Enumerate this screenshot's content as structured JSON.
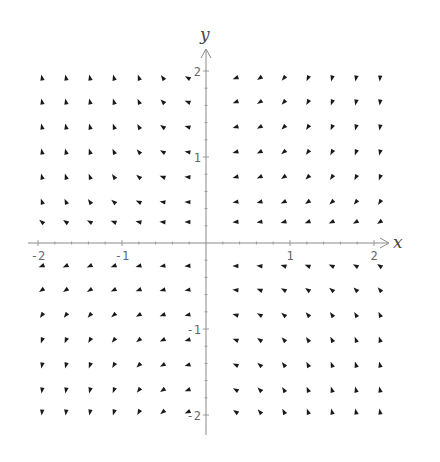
{
  "chart_data": {
    "type": "vector_field",
    "title": "",
    "xlabel": "x",
    "ylabel": "y",
    "xlim": [
      -2.1,
      2.1
    ],
    "ylim": [
      -2.2,
      2.2
    ],
    "grid": false,
    "x_ticks": [
      {
        "value": -2,
        "label": "-2"
      },
      {
        "value": -1,
        "label": "-1"
      },
      {
        "value": 1,
        "label": "1"
      },
      {
        "value": 2,
        "label": "2"
      }
    ],
    "y_ticks": [
      {
        "value": 2,
        "label": "2"
      },
      {
        "value": 1,
        "label": "1"
      },
      {
        "value": -1,
        "label": "-1"
      },
      {
        "value": -2,
        "label": "-2"
      }
    ],
    "pixel_mapping": {
      "origin_px": [
        206,
        243
      ],
      "x_unit_px": 84,
      "y_unit_px": 86
    },
    "arrow_columns_px": {
      "left": [
        42,
        66,
        90,
        114,
        139,
        163,
        188
      ],
      "right": [
        236,
        260,
        284,
        308,
        332,
        356,
        380
      ]
    },
    "arrow_rows_px": {
      "upper": [
        78,
        102,
        127,
        152,
        177,
        202,
        222
      ],
      "lower": [
        266,
        290,
        315,
        340,
        365,
        390,
        412
      ]
    },
    "arrow_angles_deg_note": "estimated visually from glyph orientation; 0 = pointing right, counter-clockwise positive",
    "quadrants": {
      "upper_left": [
        [
          100,
          100,
          102,
          105,
          110,
          125,
          150
        ],
        [
          100,
          101,
          103,
          107,
          115,
          135,
          160
        ],
        [
          101,
          102,
          105,
          110,
          120,
          145,
          165
        ],
        [
          102,
          104,
          108,
          115,
          130,
          150,
          170
        ],
        [
          104,
          107,
          112,
          125,
          140,
          160,
          175
        ],
        [
          110,
          115,
          125,
          140,
          155,
          170,
          178
        ],
        [
          140,
          145,
          150,
          160,
          168,
          175,
          180
        ]
      ],
      "upper_right": [
        [
          200,
          215,
          230,
          245,
          255,
          260,
          265
        ],
        [
          200,
          212,
          228,
          240,
          250,
          258,
          263
        ],
        [
          198,
          210,
          225,
          237,
          247,
          255,
          260
        ],
        [
          196,
          207,
          220,
          232,
          242,
          250,
          257
        ],
        [
          194,
          203,
          215,
          225,
          235,
          243,
          250
        ],
        [
          190,
          197,
          205,
          215,
          222,
          230,
          238
        ],
        [
          185,
          190,
          195,
          200,
          205,
          210,
          215
        ]
      ],
      "lower_left": [
        [
          200,
          205,
          205,
          200,
          195,
          190,
          185
        ],
        [
          215,
          215,
          212,
          207,
          200,
          195,
          190
        ],
        [
          235,
          232,
          228,
          220,
          210,
          200,
          193
        ],
        [
          250,
          247,
          240,
          230,
          218,
          205,
          195
        ],
        [
          258,
          255,
          250,
          240,
          225,
          210,
          198
        ],
        [
          262,
          260,
          255,
          248,
          232,
          215,
          200
        ],
        [
          265,
          263,
          260,
          253,
          240,
          220,
          205
        ]
      ],
      "lower_right": [
        [
          180,
          175,
          165,
          160,
          155,
          150,
          145
        ],
        [
          175,
          160,
          150,
          145,
          140,
          135,
          130
        ],
        [
          165,
          150,
          140,
          132,
          125,
          120,
          115
        ],
        [
          160,
          145,
          132,
          125,
          118,
          112,
          108
        ],
        [
          155,
          140,
          127,
          118,
          112,
          107,
          104
        ],
        [
          150,
          135,
          122,
          113,
          107,
          104,
          102
        ],
        [
          145,
          130,
          118,
          110,
          105,
          102,
          100
        ]
      ]
    }
  }
}
